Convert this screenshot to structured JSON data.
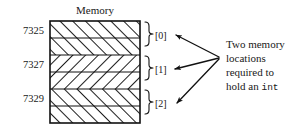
{
  "figure": {
    "title": "Memory",
    "addresses": [
      {
        "label": "7325"
      },
      {
        "label": "7327"
      },
      {
        "label": "7329"
      }
    ],
    "indices": [
      {
        "label": "[0]"
      },
      {
        "label": "[1]"
      },
      {
        "label": "[2]"
      }
    ],
    "note": {
      "line1": "Two memory",
      "line2": "locations",
      "line3": "required to",
      "line4_text": "hold an ",
      "line4_code": "int"
    },
    "colors": {
      "stroke": "#111111",
      "text": "#202020",
      "background": "#ffffff"
    },
    "rows": [
      {
        "hatch": "forward"
      },
      {
        "hatch": "forward"
      },
      {
        "hatch": "backward"
      },
      {
        "hatch": "backward"
      },
      {
        "hatch": "forward"
      },
      {
        "hatch": "forward"
      }
    ]
  }
}
